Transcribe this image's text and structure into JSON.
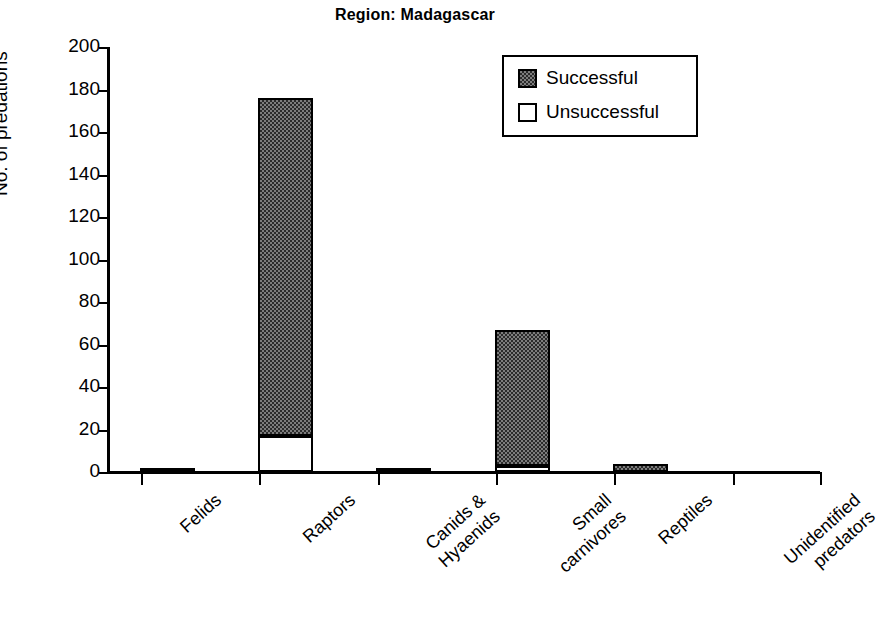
{
  "chart_data": {
    "type": "bar",
    "title": "Region: Madagascar",
    "xlabel": "",
    "ylabel": "No. of predations",
    "ylim": [
      0,
      200
    ],
    "yticks": [
      0,
      20,
      40,
      60,
      80,
      100,
      120,
      140,
      160,
      180,
      200
    ],
    "grid": false,
    "stacked": true,
    "legend_position": "top-right",
    "categories": [
      "Felids",
      "Raptors",
      "Canids & Hyaenids",
      "Small carnivores",
      "Reptiles",
      "Unidentified predators"
    ],
    "series": [
      {
        "name": "Unsuccessful",
        "values": [
          0,
          17,
          0,
          3,
          0,
          0
        ]
      },
      {
        "name": "Successful",
        "values": [
          2,
          159,
          2,
          64,
          4,
          0
        ]
      }
    ],
    "totals": [
      2,
      176,
      2,
      67,
      4,
      0
    ]
  },
  "title": {
    "text": "Region: Madagascar"
  },
  "axes": {
    "y_title": "No. of predations",
    "y_ticks": [
      "200",
      "180",
      "160",
      "140",
      "120",
      "100",
      "80",
      "60",
      "40",
      "20",
      "0"
    ],
    "x_labels": [
      {
        "line1": "Felids",
        "line2": ""
      },
      {
        "line1": "Raptors",
        "line2": ""
      },
      {
        "line1": "Canids &",
        "line2": "Hyaenids"
      },
      {
        "line1": "Small",
        "line2": "carnivores"
      },
      {
        "line1": "Reptiles",
        "line2": ""
      },
      {
        "line1": "Unidentified",
        "line2": "predators"
      }
    ]
  },
  "legend": {
    "successful_label": "Successful",
    "unsuccessful_label": "Unsuccessful"
  },
  "colors": {
    "successful_fill": "#7d7d7d",
    "successful_stipple": "#2b2b2b",
    "unsuccessful_fill": "#ffffff",
    "outline": "#000000",
    "background": "#ffffff"
  }
}
